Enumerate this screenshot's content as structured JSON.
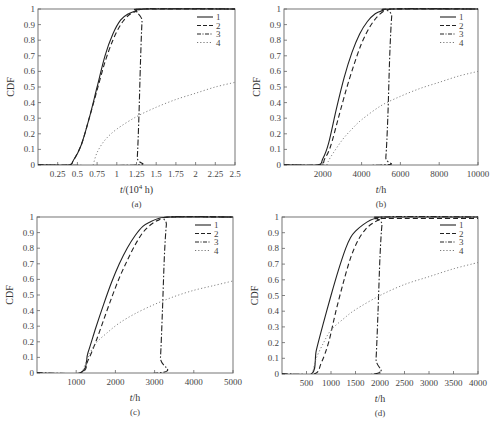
{
  "figure": {
    "panels": [
      "(a)",
      "(b)",
      "(c)",
      "(d)"
    ]
  },
  "chart_data": [
    {
      "type": "line",
      "panel_label": "(a)",
      "title": "",
      "xlabel": "t/(10^4 h)",
      "ylabel": "CDF",
      "xlim": [
        0,
        2.5
      ],
      "ylim": [
        0,
        1
      ],
      "xticks": [
        0.25,
        0.5,
        0.75,
        1,
        1.25,
        1.5,
        1.75,
        2,
        2.25,
        2.5
      ],
      "xtick_labels": [
        "0.25",
        "0.5",
        "0.75",
        "1",
        "1.25",
        "1.5",
        "1.75",
        "2",
        "2.25",
        "2.5"
      ],
      "yticks": [
        0,
        0.1,
        0.2,
        0.3,
        0.4,
        0.5,
        0.6,
        0.7,
        0.8,
        0.9,
        1
      ],
      "ytick_labels": [
        "0",
        "0.1",
        "0.2",
        "0.3",
        "0.4",
        "0.5",
        "0.6",
        "0.7",
        "0.8",
        "0.9",
        "1"
      ],
      "grid": false,
      "legend_position": "upper right",
      "box": {
        "x0": 38,
        "y0": 9,
        "x1": 235,
        "y1": 165
      },
      "series": [
        {
          "name": "1",
          "style": "solid",
          "x": [
            0,
            0.38,
            0.45,
            0.55,
            0.65,
            0.75,
            0.85,
            0.95,
            1.05,
            1.15,
            1.25,
            1.33,
            2.5
          ],
          "y": [
            0,
            0,
            0.03,
            0.13,
            0.3,
            0.5,
            0.7,
            0.84,
            0.93,
            0.97,
            0.99,
            1,
            1
          ]
        },
        {
          "name": "2",
          "style": "dashed",
          "x": [
            0,
            0.38,
            0.45,
            0.55,
            0.65,
            0.75,
            0.85,
            0.95,
            1.05,
            1.15,
            1.25,
            1.33,
            2.5
          ],
          "y": [
            0,
            0,
            0.03,
            0.13,
            0.3,
            0.48,
            0.66,
            0.8,
            0.9,
            0.96,
            0.985,
            1,
            1
          ]
        },
        {
          "name": "3",
          "style": "dashdot",
          "x": [
            0,
            1.24,
            1.26,
            1.28,
            1.3,
            1.32,
            1.34,
            2.5
          ],
          "y": [
            0,
            0,
            0.05,
            0.3,
            0.65,
            0.92,
            1,
            1
          ]
        },
        {
          "name": "4",
          "style": "dotted",
          "x": [
            0.7,
            0.75,
            0.85,
            1.0,
            1.25,
            1.5,
            1.75,
            2.0,
            2.25,
            2.5
          ],
          "y": [
            0,
            0.08,
            0.16,
            0.23,
            0.31,
            0.37,
            0.42,
            0.46,
            0.5,
            0.53
          ]
        }
      ]
    },
    {
      "type": "line",
      "panel_label": "(b)",
      "title": "",
      "xlabel": "t/h",
      "ylabel": "CDF",
      "xlim": [
        0,
        10000
      ],
      "ylim": [
        0,
        1
      ],
      "xticks": [
        2000,
        4000,
        6000,
        8000,
        10000
      ],
      "xtick_labels": [
        "2000",
        "4000",
        "6000",
        "8000",
        "10000"
      ],
      "yticks": [
        0,
        0.1,
        0.2,
        0.3,
        0.4,
        0.5,
        0.6,
        0.7,
        0.8,
        0.9,
        1
      ],
      "ytick_labels": [
        "0",
        "0.1",
        "0.2",
        "0.3",
        "0.4",
        "0.5",
        "0.6",
        "0.7",
        "0.8",
        "0.9",
        "1"
      ],
      "grid": false,
      "legend_position": "upper right",
      "box": {
        "x0": 284,
        "y0": 9,
        "x1": 478,
        "y1": 165
      },
      "series": [
        {
          "name": "1",
          "style": "solid",
          "x": [
            0,
            1700,
            2000,
            2300,
            2700,
            3100,
            3500,
            3900,
            4300,
            4700,
            5100,
            5500,
            10000
          ],
          "y": [
            0,
            0,
            0.04,
            0.14,
            0.36,
            0.56,
            0.72,
            0.84,
            0.92,
            0.97,
            0.99,
            1,
            1
          ]
        },
        {
          "name": "2",
          "style": "dashed",
          "x": [
            0,
            1800,
            2100,
            2400,
            2800,
            3200,
            3600,
            4000,
            4400,
            4800,
            5200,
            5500,
            10000
          ],
          "y": [
            0,
            0,
            0.04,
            0.12,
            0.3,
            0.48,
            0.64,
            0.78,
            0.88,
            0.95,
            0.99,
            1,
            1
          ]
        },
        {
          "name": "3",
          "style": "dashdot",
          "x": [
            0,
            5150,
            5250,
            5350,
            5450,
            5550,
            5650,
            10000
          ],
          "y": [
            0,
            0,
            0.05,
            0.3,
            0.7,
            0.95,
            1,
            1
          ]
        },
        {
          "name": "4",
          "style": "dotted",
          "x": [
            2200,
            2400,
            3000,
            3500,
            4000,
            5000,
            6000,
            7000,
            8000,
            9000,
            10000
          ],
          "y": [
            0,
            0.05,
            0.16,
            0.23,
            0.29,
            0.38,
            0.44,
            0.49,
            0.53,
            0.57,
            0.6
          ]
        }
      ]
    },
    {
      "type": "line",
      "panel_label": "(c)",
      "title": "",
      "xlabel": "t/h",
      "ylabel": "CDF",
      "xlim": [
        0,
        5000
      ],
      "ylim": [
        0,
        1
      ],
      "xticks": [
        1000,
        2000,
        3000,
        4000,
        5000
      ],
      "xtick_labels": [
        "1000",
        "2000",
        "3000",
        "4000",
        "5000"
      ],
      "yticks": [
        0,
        0.1,
        0.2,
        0.3,
        0.4,
        0.5,
        0.6,
        0.7,
        0.8,
        0.9,
        1
      ],
      "ytick_labels": [
        "0",
        "0.1",
        "0.2",
        "0.3",
        "0.4",
        "0.5",
        "0.6",
        "0.7",
        "0.8",
        "0.9",
        "1"
      ],
      "grid": false,
      "legend_position": "upper right",
      "box": {
        "x0": 37,
        "y0": 217,
        "x1": 233,
        "y1": 373
      },
      "series": [
        {
          "name": "1",
          "style": "solid",
          "x": [
            0,
            1100,
            1300,
            1500,
            1700,
            1900,
            2100,
            2300,
            2500,
            2700,
            2900,
            3100,
            3400,
            5000
          ],
          "y": [
            0,
            0,
            0.13,
            0.29,
            0.44,
            0.58,
            0.7,
            0.8,
            0.88,
            0.94,
            0.97,
            0.99,
            1,
            1
          ]
        },
        {
          "name": "2",
          "style": "dashed",
          "x": [
            0,
            1100,
            1300,
            1500,
            1700,
            1900,
            2100,
            2300,
            2500,
            2700,
            2900,
            3100,
            3400,
            5000
          ],
          "y": [
            0,
            0,
            0.08,
            0.2,
            0.34,
            0.48,
            0.61,
            0.72,
            0.82,
            0.9,
            0.95,
            0.98,
            1,
            1
          ]
        },
        {
          "name": "3",
          "style": "dashdot",
          "x": [
            0,
            3100,
            3150,
            3200,
            3250,
            3300,
            3350,
            5000
          ],
          "y": [
            0,
            0,
            0.1,
            0.4,
            0.75,
            0.95,
            1,
            1
          ]
        },
        {
          "name": "4",
          "style": "dotted",
          "x": [
            1150,
            1300,
            1500,
            1800,
            2100,
            2500,
            3000,
            3500,
            4000,
            4500,
            5000
          ],
          "y": [
            0,
            0.1,
            0.19,
            0.26,
            0.32,
            0.38,
            0.44,
            0.49,
            0.53,
            0.56,
            0.59
          ]
        }
      ]
    },
    {
      "type": "line",
      "panel_label": "(d)",
      "title": "",
      "xlabel": "t/h",
      "ylabel": "CDF",
      "xlim": [
        0,
        4000
      ],
      "ylim": [
        0,
        1
      ],
      "xticks": [
        500,
        1000,
        1500,
        2000,
        2500,
        3000,
        3500,
        4000
      ],
      "xtick_labels": [
        "500",
        "1000",
        "1500",
        "2000",
        "2500",
        "3000",
        "3500",
        "4000"
      ],
      "yticks": [
        0,
        0.1,
        0.2,
        0.3,
        0.4,
        0.5,
        0.6,
        0.7,
        0.8,
        0.9,
        1
      ],
      "ytick_labels": [
        "0",
        "0.1",
        "0.2",
        "0.3",
        "0.4",
        "0.5",
        "0.6",
        "0.7",
        "0.8",
        "0.9",
        "1"
      ],
      "grid": false,
      "legend_position": "upper right",
      "box": {
        "x0": 282,
        "y0": 217,
        "x1": 478,
        "y1": 374
      },
      "series": [
        {
          "name": "1",
          "style": "solid",
          "x": [
            0,
            600,
            700,
            850,
            1000,
            1150,
            1300,
            1400,
            1500,
            1650,
            1800,
            1950,
            2050,
            4000
          ],
          "y": [
            0,
            0,
            0.15,
            0.33,
            0.5,
            0.66,
            0.8,
            0.87,
            0.91,
            0.95,
            0.98,
            0.995,
            1,
            1
          ]
        },
        {
          "name": "2",
          "style": "dashed",
          "x": [
            0,
            650,
            800,
            950,
            1100,
            1250,
            1400,
            1550,
            1700,
            1850,
            2000,
            2050,
            4000
          ],
          "y": [
            0,
            0,
            0.07,
            0.2,
            0.4,
            0.58,
            0.74,
            0.85,
            0.92,
            0.96,
            0.985,
            0.99,
            0.99
          ]
        },
        {
          "name": "3",
          "style": "dashdot",
          "x": [
            0,
            1880,
            1920,
            1960,
            2000,
            2040,
            2080,
            4000
          ],
          "y": [
            0,
            0,
            0.1,
            0.4,
            0.75,
            0.95,
            1,
            1
          ]
        },
        {
          "name": "4",
          "style": "dotted",
          "x": [
            620,
            700,
            850,
            1000,
            1250,
            1500,
            2000,
            2500,
            3000,
            3500,
            4000
          ],
          "y": [
            0,
            0.1,
            0.2,
            0.28,
            0.35,
            0.41,
            0.5,
            0.57,
            0.62,
            0.67,
            0.71
          ]
        }
      ]
    }
  ]
}
